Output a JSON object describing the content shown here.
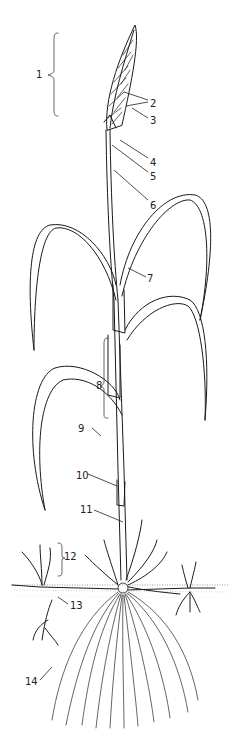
{
  "diagram": {
    "style": "black ink line drawing on white",
    "colors": {
      "ink": "#1a1a1a",
      "background": "#ffffff",
      "soil": "#555555"
    },
    "labels": [
      {
        "n": "1",
        "x": 36,
        "y": 74,
        "target": "inflorescence (bracket)"
      },
      {
        "n": "2",
        "x": 151,
        "y": 103,
        "target": "spikelets"
      },
      {
        "n": "3",
        "x": 151,
        "y": 121,
        "target": "awn/glume"
      },
      {
        "n": "4",
        "x": 151,
        "y": 162,
        "target": "lower spikelet"
      },
      {
        "n": "5",
        "x": 151,
        "y": 176,
        "target": "rachis base"
      },
      {
        "n": "6",
        "x": 151,
        "y": 205,
        "target": "culm/peduncle"
      },
      {
        "n": "7",
        "x": 148,
        "y": 279,
        "target": "ligule/collar"
      },
      {
        "n": "8",
        "x": 97,
        "y": 386,
        "target": "leaf sheath (bracket)"
      },
      {
        "n": "9",
        "x": 78,
        "y": 430,
        "target": "leaf blade"
      },
      {
        "n": "10",
        "x": 78,
        "y": 477,
        "target": "node"
      },
      {
        "n": "11",
        "x": 82,
        "y": 511,
        "target": "internode"
      },
      {
        "n": "12",
        "x": 62,
        "y": 558,
        "target": "tiller (bracket)"
      },
      {
        "n": "13",
        "x": 72,
        "y": 606,
        "target": "rhizome/stolon"
      },
      {
        "n": "14",
        "x": 26,
        "y": 683,
        "target": "fibrous roots"
      }
    ]
  }
}
